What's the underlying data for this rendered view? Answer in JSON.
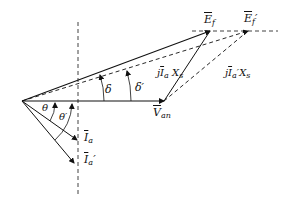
{
  "diagram": {
    "type": "phasor-diagram",
    "colors": {
      "line": "#111111",
      "background": "#ffffff"
    },
    "labels": {
      "Ef": {
        "main": "E",
        "sub": "f",
        "prime": ""
      },
      "Ef_prime": {
        "main": "E",
        "sub": "f",
        "prime": "′"
      },
      "Van": {
        "main": "V",
        "sub": "an"
      },
      "jIaXs": {
        "pre": "j",
        "I": "I",
        "sub": "a",
        "prime": "",
        "X": "X",
        "xsub": "s"
      },
      "jIaXs_prime": {
        "pre": "j",
        "I": "I",
        "sub": "a",
        "prime": "′",
        "X": "X",
        "xsub": "s"
      },
      "Ia": {
        "main": "I",
        "sub": "a",
        "prime": ""
      },
      "Ia_prime": {
        "main": "I",
        "sub": "a",
        "prime": "′"
      },
      "delta": "δ",
      "delta_prime": "δ′",
      "theta": "θ",
      "theta_prime": "θ′"
    },
    "points": {
      "origin": [
        22,
        101
      ],
      "Van_tip": [
        164,
        101
      ],
      "Ef_tip": [
        210,
        31
      ],
      "Ef_prime_tip": [
        248,
        31
      ],
      "Ia_tip": [
        77,
        140
      ],
      "Ia_prime_tip": [
        74,
        163
      ]
    }
  }
}
